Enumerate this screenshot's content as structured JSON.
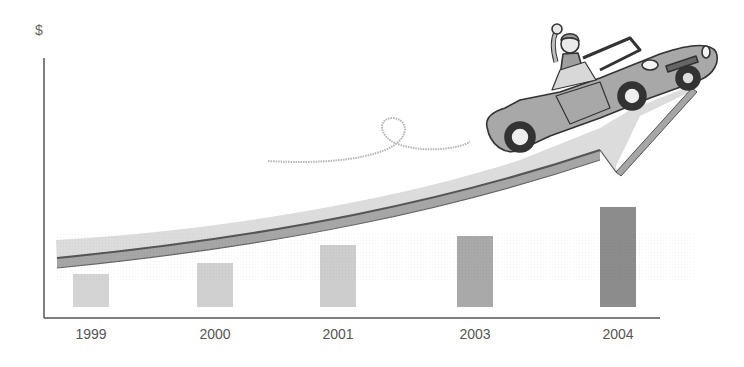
{
  "chart_data": {
    "type": "bar",
    "title": "",
    "xlabel": "",
    "ylabel": "$",
    "categories": [
      "1999",
      "2000",
      "2001",
      "2003",
      "2004"
    ],
    "values": [
      33,
      44,
      62,
      71,
      100
    ],
    "value_units": "relative height (2004 = 100), no numeric axis ticks shown",
    "ylim": [
      0,
      100
    ],
    "grid": false,
    "legend": null,
    "bar_colors": [
      "#d4d4d4",
      "#d0d0d0",
      "#cdcdcd",
      "#a9a9a9",
      "#8c8c8c"
    ],
    "annotations": [
      "Upward-curving growth arrow across the chart",
      "Cartoon convertible car with waving driver riding the arrow",
      "Looped dotted trail line behind the car"
    ]
  },
  "axis": {
    "y_label": "$",
    "x_ticks": [
      "1999",
      "2000",
      "2001",
      "2003",
      "2004"
    ]
  },
  "colors": {
    "axis": "#555555",
    "arrow_fill": "#dcdcdc",
    "arrow_edge": "#a6a6a6",
    "arrow_line": "#555555",
    "car_body": "#a8a8a8",
    "trail": "#b5b5b5"
  }
}
